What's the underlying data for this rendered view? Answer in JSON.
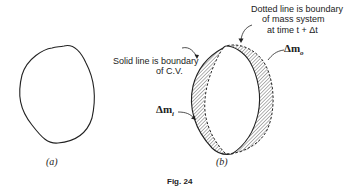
{
  "figure": {
    "caption": "Fig. 24",
    "panel_a": {
      "label": "(a)"
    },
    "panel_b": {
      "label": "(b)",
      "annotations": {
        "solid_line_line1": "Solid line is boundary",
        "solid_line_line2": "of C.V.",
        "dotted_line_line1": "Dotted line is boundary",
        "dotted_line_line2": "of mass system",
        "dotted_line_line3": "at time t + Δt",
        "delta_m_o": "Δm",
        "delta_m_o_sub": "o",
        "delta_m_i": "Δm",
        "delta_m_i_sub": "i"
      }
    }
  },
  "colors": {
    "line": "#222222",
    "hatch": "#888888",
    "background": "#ffffff"
  }
}
